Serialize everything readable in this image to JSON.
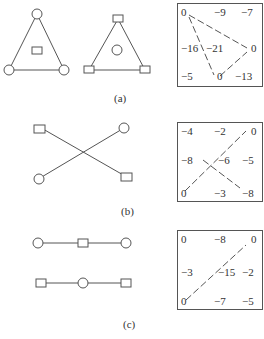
{
  "panels": [
    {
      "id": "a",
      "caption": "(a)",
      "graphs": [
        {
          "name": "triangle-circles-corners",
          "nodes": [
            "circle-top",
            "circle-bottom-left",
            "circle-bottom-right",
            "square-center"
          ]
        },
        {
          "name": "triangle-squares-corners",
          "nodes": [
            "square-top",
            "square-bottom-left",
            "square-bottom-right",
            "circle-center"
          ]
        }
      ],
      "matrix": [
        [
          "0",
          "−9",
          "−7"
        ],
        [
          "−16",
          "−21",
          "0"
        ],
        [
          "−5",
          "0",
          "−13"
        ]
      ]
    },
    {
      "id": "b",
      "caption": "(b)",
      "graphs": [
        {
          "name": "cross-graph",
          "nodes": [
            "square-top-left",
            "circle-top-right",
            "circle-bottom-left",
            "square-bottom-right"
          ]
        }
      ],
      "matrix": [
        [
          "−4",
          "−2",
          "0"
        ],
        [
          "−8",
          "−6",
          "−5"
        ],
        [
          "0",
          "−3",
          "−8"
        ]
      ]
    },
    {
      "id": "c",
      "caption": "(c)",
      "graphs": [
        {
          "name": "line-circle-square-circle",
          "nodes": [
            "circle",
            "square",
            "circle"
          ]
        },
        {
          "name": "line-square-circle-square",
          "nodes": [
            "square",
            "circle",
            "square"
          ]
        }
      ],
      "matrix": [
        [
          "0",
          "−8",
          "0"
        ],
        [
          "−3",
          "−15",
          "−2"
        ],
        [
          "0",
          "−7",
          "−5"
        ]
      ]
    }
  ]
}
